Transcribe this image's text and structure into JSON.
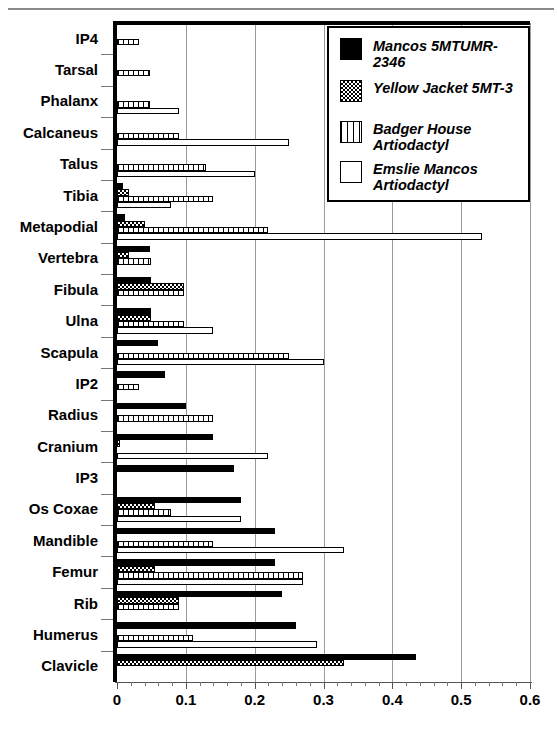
{
  "chart_data": {
    "type": "bar",
    "orientation": "horizontal",
    "title": "",
    "subtitle": "",
    "xlabel": "",
    "ylabel": "",
    "xlim": [
      0,
      0.6
    ],
    "ylim": null,
    "grid": true,
    "grid_axis": "x",
    "legend_position": "top-right",
    "x_ticks": [
      "0",
      "0.1",
      "0.2",
      "0.3",
      "0.4",
      "0.5",
      "0.6"
    ],
    "x_tick_values": [
      0,
      0.1,
      0.2,
      0.3,
      0.4,
      0.5,
      0.6
    ],
    "x_minor_tick_step": 0.02,
    "categories": [
      "IP4",
      "Tarsal",
      "Phalanx",
      "Calcaneus",
      "Talus",
      "Tibia",
      "Metapodial",
      "Vertebra",
      "Fibula",
      "Ulna",
      "Scapula",
      "IP2",
      "Radius",
      "Cranium",
      "IP3",
      "Os Coxae",
      "Mandible",
      "Femur",
      "Rib",
      "Humerus",
      "Clavicle"
    ],
    "series": [
      {
        "name": "Mancos 5MTUMR-2346",
        "fill": "solid-black",
        "values": [
          0,
          0,
          0,
          0,
          0,
          0.008,
          0.012,
          0.048,
          0.05,
          0.05,
          0.06,
          0.07,
          0.1,
          0.14,
          0.17,
          0.18,
          0.23,
          0.23,
          0.24,
          0.26,
          0.435
        ]
      },
      {
        "name": "Yellow Jacket 5MT-3",
        "fill": "checker",
        "values": [
          0,
          0,
          0,
          0,
          0,
          0.018,
          0.04,
          0.018,
          0.098,
          0.05,
          0,
          0,
          0,
          0.004,
          0,
          0.055,
          0,
          0.055,
          0.09,
          0,
          0.33
        ]
      },
      {
        "name": "Badger House Artiodactyl",
        "fill": "vertical-hatch",
        "values": [
          0.032,
          0.048,
          0.048,
          0.09,
          0.13,
          0.14,
          0.22,
          0.05,
          0.098,
          0.098,
          0.25,
          0.032,
          0.14,
          0,
          0,
          0.078,
          0.14,
          0.27,
          0.09,
          0.11,
          0
        ]
      },
      {
        "name": "Emslie Mancos Artiodactyl",
        "fill": "open-white",
        "values": [
          0,
          0,
          0.09,
          0.25,
          0.2,
          0.078,
          0.53,
          0,
          0,
          0.14,
          0.3,
          0,
          0,
          0.22,
          0,
          0.18,
          0.33,
          0.27,
          0,
          0.29,
          0
        ]
      }
    ]
  },
  "legend": {
    "items": [
      {
        "label": "Mancos 5MTUMR-2346",
        "swatch": "solid-black-swatch"
      },
      {
        "label": "Yellow Jacket 5MT-3",
        "swatch": "checker-swatch"
      },
      {
        "label": "Badger House Artiodactyl",
        "swatch": "vertical-hatch-swatch"
      },
      {
        "label": "Emslie Mancos Artiodactyl",
        "swatch": "open-white-swatch"
      }
    ]
  },
  "colors": {
    "foreground": "#000000",
    "background": "#ffffff",
    "gridline": "#9a9a9a",
    "axis": "#555555"
  }
}
